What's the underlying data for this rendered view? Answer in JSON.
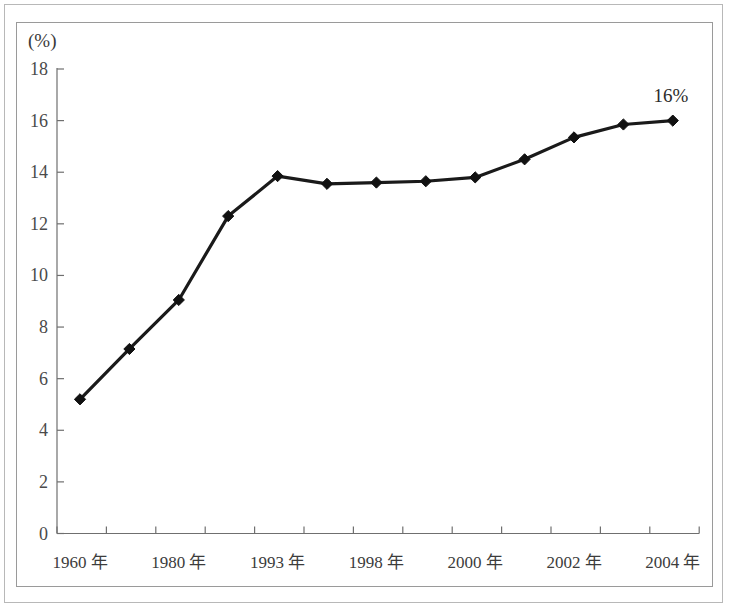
{
  "figure": {
    "axis_unit_label": "(%)",
    "annotation": {
      "text": "16%",
      "x_value_index": 12
    },
    "line_color": "#1a1a1a",
    "marker_color": "#111111",
    "axis_color": "#6f6f6f",
    "frame_color": "#9a9a9a",
    "outer_border_color": "#b8b8b8",
    "background_color": "#ffffff"
  },
  "chart_data": {
    "type": "line",
    "title": "",
    "xlabel": "",
    "ylabel": "(%)",
    "ylim": [
      0,
      18
    ],
    "grid": false,
    "legend": "none",
    "y_ticks": [
      0,
      2,
      4,
      6,
      8,
      10,
      12,
      14,
      16,
      18
    ],
    "y_tick_labels": [
      "0",
      "2",
      "4",
      "6",
      "8",
      "10",
      "12",
      "14",
      "16",
      "18"
    ],
    "categories": [
      "1960 年",
      "",
      "1980 年",
      "",
      "1993 年",
      "",
      "1998 年",
      "",
      "2000 年",
      "",
      "2002 年",
      "",
      "2004 年"
    ],
    "x_tick_labels_shown": [
      "1960 年",
      "1980 年",
      "1993 年",
      "1998 年",
      "2000 年",
      "2002 年",
      "2004 年"
    ],
    "values": [
      5.2,
      7.15,
      9.05,
      12.3,
      13.85,
      13.55,
      13.6,
      13.65,
      13.8,
      14.5,
      15.35,
      15.85,
      16.0
    ],
    "annotations": [
      {
        "text": "16%",
        "index": 12,
        "value": 16.0
      }
    ]
  }
}
